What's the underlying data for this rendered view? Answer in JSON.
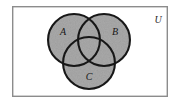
{
  "figure": {
    "kind": "venn-diagram",
    "set_count": 3,
    "canvas": {
      "width": 179,
      "height": 106
    },
    "background_color": "#ffffff"
  },
  "universe": {
    "label": "U",
    "label_x": 158,
    "label_y": 21,
    "rect": {
      "x": 12,
      "y": 6,
      "width": 156,
      "height": 91
    },
    "border_color": "#8c8c8c",
    "border_width": 1.4,
    "fill_color": "#ffffff"
  },
  "circles": [
    {
      "label": "A",
      "name": "set-a",
      "cx": 74,
      "cy": 40,
      "r": 27,
      "fill_color": "#a9a9a9",
      "stroke_color": "#171717",
      "stroke_width": 2.1,
      "label_x": 63,
      "label_y": 33
    },
    {
      "label": "B",
      "name": "set-b",
      "cx": 104,
      "cy": 40,
      "r": 27,
      "fill_color": "#a9a9a9",
      "stroke_color": "#171717",
      "stroke_width": 2.1,
      "label_x": 115,
      "label_y": 33
    },
    {
      "label": "C",
      "name": "set-c",
      "cx": 89,
      "cy": 63,
      "r": 27,
      "fill_color": "#a9a9a9",
      "stroke_color": "#171717",
      "stroke_width": 2.1,
      "label_x": 89,
      "label_y": 78
    }
  ]
}
